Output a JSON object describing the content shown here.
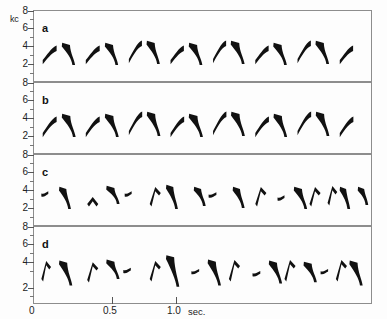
{
  "figure": {
    "axis_unit_label": "kc",
    "x_unit_label": "sec.",
    "accent_color": "#111111",
    "frame_color": "#8d8d8d"
  },
  "y_axis": {
    "tick_labels": [
      "8",
      "6",
      "4",
      "2"
    ],
    "panel_tick_values": [
      8,
      6,
      4,
      2
    ],
    "zero_label": "0"
  },
  "x_axis": {
    "tick_labels": [
      "0",
      "0.5",
      "1.0"
    ],
    "tick_values": [
      0,
      0.5,
      1.0
    ],
    "unit": "sec."
  },
  "panels": [
    {
      "letter": "a"
    },
    {
      "letter": "b"
    },
    {
      "letter": "c"
    },
    {
      "letter": "d"
    }
  ],
  "chart_data": {
    "type": "line",
    "title": "",
    "xlabel": "sec.",
    "ylabel": "kc",
    "xlim": [
      0,
      1.22
    ],
    "ylim": [
      1.2,
      8.4
    ],
    "grid": false,
    "legend": "none",
    "x_ticks": [
      0,
      0.5,
      1.0
    ],
    "x_tick_labels": [
      "0",
      "0.5",
      "1.0"
    ],
    "y_ticks": [
      2,
      4,
      6,
      8
    ],
    "y_tick_labels": [
      "2",
      "4",
      "6",
      "8"
    ],
    "series": [
      {
        "name": "a",
        "panel": "a",
        "description": "Fourteen repeated two-part song elements: alternating rising glide (3.2 to 4.6 kc) and falling glide (5.0 down to 3.0 kc).",
        "elements": [
          {
            "t_start": 0.035,
            "t_end": 0.085,
            "f_start": 3.3,
            "f_end": 4.6,
            "shape": "rise"
          },
          {
            "t_start": 0.105,
            "t_end": 0.15,
            "f_start": 5.0,
            "f_end": 2.9,
            "shape": "fall"
          },
          {
            "t_start": 0.19,
            "t_end": 0.24,
            "f_start": 3.3,
            "f_end": 4.6,
            "shape": "rise"
          },
          {
            "t_start": 0.26,
            "t_end": 0.305,
            "f_start": 5.0,
            "f_end": 2.9,
            "shape": "fall"
          },
          {
            "t_start": 0.345,
            "t_end": 0.392,
            "f_start": 3.4,
            "f_end": 5.1,
            "shape": "rise"
          },
          {
            "t_start": 0.41,
            "t_end": 0.455,
            "f_start": 5.2,
            "f_end": 3.0,
            "shape": "fall"
          },
          {
            "t_start": 0.495,
            "t_end": 0.543,
            "f_start": 3.3,
            "f_end": 4.6,
            "shape": "rise"
          },
          {
            "t_start": 0.562,
            "t_end": 0.608,
            "f_start": 5.0,
            "f_end": 2.9,
            "shape": "fall"
          },
          {
            "t_start": 0.648,
            "t_end": 0.695,
            "f_start": 3.4,
            "f_end": 5.1,
            "shape": "rise"
          },
          {
            "t_start": 0.713,
            "t_end": 0.76,
            "f_start": 5.2,
            "f_end": 3.0,
            "shape": "fall"
          },
          {
            "t_start": 0.8,
            "t_end": 0.848,
            "f_start": 3.3,
            "f_end": 4.6,
            "shape": "rise"
          },
          {
            "t_start": 0.866,
            "t_end": 0.912,
            "f_start": 5.0,
            "f_end": 2.9,
            "shape": "fall"
          },
          {
            "t_start": 0.952,
            "t_end": 1.0,
            "f_start": 3.4,
            "f_end": 5.1,
            "shape": "rise"
          },
          {
            "t_start": 1.018,
            "t_end": 1.064,
            "f_start": 5.2,
            "f_end": 3.0,
            "shape": "fall"
          },
          {
            "t_start": 1.104,
            "t_end": 1.152,
            "f_start": 3.3,
            "f_end": 4.6,
            "shape": "rise"
          }
        ]
      },
      {
        "name": "b",
        "panel": "b",
        "description": "Same alternating rise/fall element pattern as a, slightly heavier strokes.",
        "elements": [
          {
            "t_start": 0.035,
            "t_end": 0.085,
            "f_start": 3.2,
            "f_end": 4.7,
            "shape": "rise"
          },
          {
            "t_start": 0.105,
            "t_end": 0.152,
            "f_start": 5.1,
            "f_end": 2.9,
            "shape": "fall"
          },
          {
            "t_start": 0.19,
            "t_end": 0.24,
            "f_start": 3.2,
            "f_end": 4.7,
            "shape": "rise"
          },
          {
            "t_start": 0.26,
            "t_end": 0.307,
            "f_start": 5.1,
            "f_end": 2.9,
            "shape": "fall"
          },
          {
            "t_start": 0.345,
            "t_end": 0.393,
            "f_start": 3.4,
            "f_end": 5.2,
            "shape": "rise"
          },
          {
            "t_start": 0.411,
            "t_end": 0.457,
            "f_start": 5.3,
            "f_end": 3.0,
            "shape": "fall"
          },
          {
            "t_start": 0.495,
            "t_end": 0.544,
            "f_start": 3.2,
            "f_end": 4.7,
            "shape": "rise"
          },
          {
            "t_start": 0.562,
            "t_end": 0.61,
            "f_start": 5.1,
            "f_end": 2.9,
            "shape": "fall"
          },
          {
            "t_start": 0.648,
            "t_end": 0.696,
            "f_start": 3.4,
            "f_end": 5.2,
            "shape": "rise"
          },
          {
            "t_start": 0.714,
            "t_end": 0.761,
            "f_start": 5.3,
            "f_end": 3.0,
            "shape": "fall"
          },
          {
            "t_start": 0.8,
            "t_end": 0.849,
            "f_start": 3.2,
            "f_end": 4.7,
            "shape": "rise"
          },
          {
            "t_start": 0.867,
            "t_end": 0.913,
            "f_start": 5.1,
            "f_end": 2.9,
            "shape": "fall"
          },
          {
            "t_start": 0.952,
            "t_end": 1.001,
            "f_start": 3.4,
            "f_end": 5.2,
            "shape": "rise"
          },
          {
            "t_start": 1.019,
            "t_end": 1.065,
            "f_start": 5.3,
            "f_end": 3.0,
            "shape": "fall"
          },
          {
            "t_start": 1.104,
            "t_end": 1.153,
            "f_start": 3.2,
            "f_end": 4.7,
            "shape": "rise"
          }
        ]
      },
      {
        "name": "c",
        "panel": "c",
        "description": "Lower-amplitude, more compressed elements: short flat dashes near 4.2 kc alternating with narrow inverted-V peaks and steep falling strokes between 5.2 and 2.8 kc.",
        "elements": [
          {
            "t_start": 0.03,
            "t_end": 0.055,
            "f_start": 4.3,
            "f_end": 4.2,
            "shape": "flat"
          },
          {
            "t_start": 0.095,
            "t_end": 0.135,
            "f_start": 5.0,
            "f_end": 2.9,
            "shape": "fall"
          },
          {
            "t_start": 0.195,
            "t_end": 0.235,
            "f_start": 3.6,
            "f_end": 3.5,
            "shape": "peak"
          },
          {
            "t_start": 0.265,
            "t_end": 0.31,
            "f_start": 5.1,
            "f_end": 3.4,
            "shape": "fall"
          },
          {
            "t_start": 0.33,
            "t_end": 0.355,
            "f_start": 4.3,
            "f_end": 4.2,
            "shape": "flat"
          },
          {
            "t_start": 0.42,
            "t_end": 0.46,
            "f_start": 3.6,
            "f_end": 4.6,
            "shape": "peak"
          },
          {
            "t_start": 0.48,
            "t_end": 0.52,
            "f_start": 5.2,
            "f_end": 2.9,
            "shape": "fall"
          },
          {
            "t_start": 0.58,
            "t_end": 0.62,
            "f_start": 5.0,
            "f_end": 3.2,
            "shape": "fall"
          },
          {
            "t_start": 0.632,
            "t_end": 0.66,
            "f_start": 4.2,
            "f_end": 4.1,
            "shape": "flat"
          },
          {
            "t_start": 0.72,
            "t_end": 0.76,
            "f_start": 5.0,
            "f_end": 3.0,
            "shape": "fall"
          },
          {
            "t_start": 0.8,
            "t_end": 0.84,
            "f_start": 3.6,
            "f_end": 4.6,
            "shape": "peak"
          },
          {
            "t_start": 0.88,
            "t_end": 0.905,
            "f_start": 3.9,
            "f_end": 3.8,
            "shape": "flat"
          },
          {
            "t_start": 0.94,
            "t_end": 0.985,
            "f_start": 5.0,
            "f_end": 2.9,
            "shape": "fall"
          },
          {
            "t_start": 0.995,
            "t_end": 1.035,
            "f_start": 3.6,
            "f_end": 4.6,
            "shape": "peak"
          },
          {
            "t_start": 1.06,
            "t_end": 1.095,
            "f_start": 3.7,
            "f_end": 4.7,
            "shape": "peak"
          },
          {
            "t_start": 1.105,
            "t_end": 1.14,
            "f_start": 5.0,
            "f_end": 2.9,
            "shape": "fall"
          },
          {
            "t_start": 1.17,
            "t_end": 1.205,
            "f_start": 5.0,
            "f_end": 3.3,
            "shape": "fall"
          }
        ]
      },
      {
        "name": "d",
        "panel": "d",
        "description": "Similar compressed pattern to c with clearer inverted-V peaks and steep falling strokes, range roughly 2.8 to 5.6 kc.",
        "elements": [
          {
            "t_start": 0.03,
            "t_end": 0.065,
            "f_start": 3.7,
            "f_end": 4.7,
            "shape": "peak"
          },
          {
            "t_start": 0.095,
            "t_end": 0.14,
            "f_start": 5.1,
            "f_end": 2.9,
            "shape": "fall"
          },
          {
            "t_start": 0.195,
            "t_end": 0.235,
            "f_start": 3.6,
            "f_end": 4.6,
            "shape": "peak"
          },
          {
            "t_start": 0.265,
            "t_end": 0.31,
            "f_start": 5.2,
            "f_end": 3.5,
            "shape": "fall"
          },
          {
            "t_start": 0.325,
            "t_end": 0.352,
            "f_start": 4.2,
            "f_end": 4.1,
            "shape": "flat"
          },
          {
            "t_start": 0.42,
            "t_end": 0.46,
            "f_start": 3.7,
            "f_end": 4.7,
            "shape": "peak"
          },
          {
            "t_start": 0.48,
            "t_end": 0.525,
            "f_start": 5.6,
            "f_end": 2.8,
            "shape": "fall"
          },
          {
            "t_start": 0.57,
            "t_end": 0.598,
            "f_start": 4.1,
            "f_end": 4.0,
            "shape": "flat"
          },
          {
            "t_start": 0.63,
            "t_end": 0.675,
            "f_start": 5.2,
            "f_end": 2.9,
            "shape": "fall"
          },
          {
            "t_start": 0.705,
            "t_end": 0.745,
            "f_start": 3.7,
            "f_end": 4.8,
            "shape": "peak"
          },
          {
            "t_start": 0.79,
            "t_end": 0.818,
            "f_start": 3.9,
            "f_end": 3.8,
            "shape": "flat"
          },
          {
            "t_start": 0.85,
            "t_end": 0.895,
            "f_start": 5.1,
            "f_end": 3.1,
            "shape": "fall"
          },
          {
            "t_start": 0.905,
            "t_end": 0.945,
            "f_start": 3.7,
            "f_end": 4.8,
            "shape": "peak"
          },
          {
            "t_start": 0.975,
            "t_end": 1.02,
            "f_start": 5.0,
            "f_end": 3.2,
            "shape": "fall"
          },
          {
            "t_start": 1.035,
            "t_end": 1.062,
            "f_start": 4.1,
            "f_end": 4.0,
            "shape": "flat"
          },
          {
            "t_start": 1.09,
            "t_end": 1.13,
            "f_start": 3.7,
            "f_end": 4.8,
            "shape": "peak"
          },
          {
            "t_start": 1.14,
            "t_end": 1.185,
            "f_start": 5.1,
            "f_end": 2.9,
            "shape": "fall"
          }
        ]
      }
    ]
  }
}
